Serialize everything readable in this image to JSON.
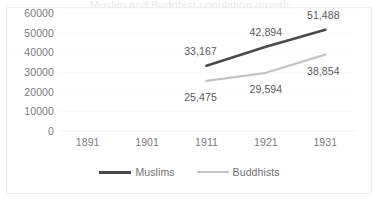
{
  "card": {
    "clipped_title": "Muslim and Buddhist population growth",
    "border_color": "#eceef0",
    "background": "#ffffff"
  },
  "chart_data": {
    "type": "line",
    "title": "",
    "xlabel": "",
    "ylabel": "",
    "categories": [
      "1891",
      "1901",
      "1911",
      "1921",
      "1931"
    ],
    "ylim": [
      0,
      60000
    ],
    "yticks": [
      "0",
      "10000",
      "20000",
      "30000",
      "40000",
      "50000",
      "60000"
    ],
    "ytick_values": [
      0,
      10000,
      20000,
      30000,
      40000,
      50000,
      60000
    ],
    "grid": true,
    "legend_position": "bottom",
    "series": [
      {
        "name": "Muslims",
        "color": "#4a4a4c",
        "values": [
          null,
          null,
          33167,
          42894,
          51488
        ],
        "data_labels": [
          "",
          "",
          "33,167",
          "42,894",
          "51,488"
        ]
      },
      {
        "name": "Buddhists",
        "color": "#c3c3c5",
        "values": [
          null,
          null,
          25475,
          29594,
          38854
        ],
        "data_labels": [
          "",
          "",
          "25,475",
          "29,594",
          "38,854"
        ]
      }
    ]
  },
  "labels": {
    "muslims_1911": "33,167",
    "muslims_1921": "42,894",
    "muslims_1931": "51,488",
    "buddhists_1911": "25,475",
    "buddhists_1921": "29,594",
    "buddhists_1931": "38,854"
  },
  "legend": {
    "items": [
      {
        "label": "Muslims",
        "color": "#4a4a4c"
      },
      {
        "label": "Buddhists",
        "color": "#c3c3c5"
      }
    ]
  }
}
